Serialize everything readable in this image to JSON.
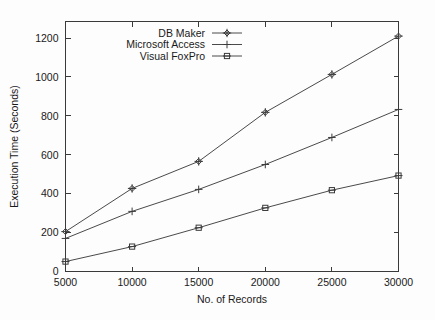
{
  "chart_data": {
    "type": "line",
    "title": "",
    "xlabel": "No. of Records",
    "ylabel": "Execution Time (Seconds)",
    "x": [
      5000,
      10000,
      15000,
      20000,
      25000,
      30000
    ],
    "xticklabels": [
      "5000",
      "10000",
      "15000",
      "20000",
      "25000",
      "30000"
    ],
    "yticklabels": [
      "0",
      "200",
      "400",
      "600",
      "800",
      "1000",
      "1200"
    ],
    "yticks": [
      0,
      200,
      400,
      600,
      800,
      1000,
      1200
    ],
    "xlim": [
      5000,
      30000
    ],
    "ylim": [
      0,
      1285
    ],
    "grid": false,
    "legend_position": "top-left-inside",
    "series": [
      {
        "name": "DB Maker",
        "marker": "diamond",
        "values": [
          205,
          427,
          566,
          818,
          1013,
          1210
        ]
      },
      {
        "name": "Microsoft Access",
        "marker": "plus",
        "values": [
          170,
          309,
          422,
          550,
          689,
          833
        ]
      },
      {
        "name": "Visual FoxPro",
        "marker": "square",
        "values": [
          51,
          128,
          225,
          327,
          418,
          493
        ]
      }
    ],
    "colors": {
      "axis": "#3a3a3a",
      "series": "#4a4a4a",
      "background": "#fdfdfd",
      "text": "#1a1a1a"
    }
  }
}
